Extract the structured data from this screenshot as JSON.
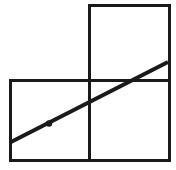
{
  "canvas": {
    "width": 176,
    "height": 170,
    "background_color": "#ffffff",
    "title": "L-shaped figure of three unit squares with a diagonal line and a marked point"
  },
  "style": {
    "stroke_color": "#1a1a1a",
    "square_stroke_width": 3,
    "diagonal_stroke_width": 4,
    "point_color": "#1a1a1a",
    "point_radius": 3.2
  },
  "chart_data": {
    "type": "diagram",
    "title": "",
    "xlabel": "",
    "ylabel": "",
    "squares": [
      {
        "name": "bottom-left-square",
        "x": 10,
        "y": 80,
        "width": 79,
        "height": 80
      },
      {
        "name": "bottom-right-square",
        "x": 89,
        "y": 80,
        "width": 80,
        "height": 80
      },
      {
        "name": "top-right-square",
        "x": 89,
        "y": 5,
        "width": 80,
        "height": 75
      }
    ],
    "segments": [
      {
        "name": "diagonal-line",
        "x1": 11,
        "y1": 142,
        "x2": 168,
        "y2": 62
      }
    ],
    "points": [
      {
        "name": "marked-point",
        "x": 49,
        "y": 123.5,
        "label": ""
      }
    ],
    "labels": []
  }
}
